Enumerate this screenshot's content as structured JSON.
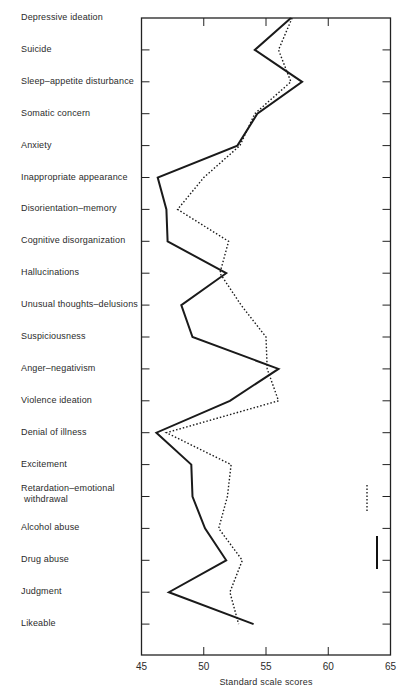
{
  "chart_data": {
    "type": "line",
    "orientation": "horizontal-profile",
    "title": "",
    "xlabel": "Standard scale scores",
    "ylabel": "",
    "xlim": [
      45,
      65
    ],
    "x_ticks": [
      45,
      50,
      55,
      60,
      65
    ],
    "grid": false,
    "categories": [
      "Depressive ideation",
      "Suicide",
      "Sleep-appetite disturbance",
      "Somatic concern",
      "Anxiety",
      "Inappropriate appearance",
      "Disorientation-memory",
      "Cognitive disorganization",
      "Hallucinations",
      "Unusual thoughts-delusions",
      "Suspiciousness",
      "Anger-negativism",
      "Violence ideation",
      "Denial of illness",
      "Excitement",
      "Retardation-emotional withdrawal",
      "Alcohol abuse",
      "Drug abuse",
      "Judgment",
      "Likeable"
    ],
    "series": [
      {
        "name": "solid",
        "style": "solid",
        "color": "#1a1a1a",
        "values": [
          57.0,
          54.1,
          57.9,
          54.3,
          52.7,
          46.3,
          47.0,
          47.1,
          51.8,
          48.2,
          49.1,
          56.0,
          52.1,
          46.2,
          49.0,
          49.1,
          50.1,
          51.8,
          47.2,
          54.0
        ]
      },
      {
        "name": "dotted",
        "style": "dotted",
        "color": "#1a1a1a",
        "values": [
          57.1,
          56.0,
          57.0,
          54.1,
          52.9,
          50.0,
          47.9,
          52.0,
          51.3,
          53.0,
          55.0,
          55.1,
          56.0,
          47.0,
          52.2,
          51.9,
          51.2,
          53.1,
          52.1,
          52.8
        ]
      }
    ],
    "legend": {
      "position": "right-inside",
      "note": "short dotted and solid bar marks at right edge, no text"
    }
  },
  "labels": {
    "categories": [
      "Depressive ideation",
      "Suicide",
      "Sleep–appetite disturbance",
      "Somatic concern",
      "Anxiety",
      "Inappropriate appearance",
      "Disorientation–memory",
      "Cognitive disorganization",
      "Hallucinations",
      "Unusual thoughts–delusions",
      "Suspiciousness",
      "Anger–negativism",
      "Violence ideation",
      "Denial of illness",
      "Excitement",
      "Retardation–emotional\n withdrawal",
      "Alcohol abuse",
      "Drug abuse",
      "Judgment",
      "Likeable"
    ],
    "x_ticks": [
      "45",
      "50",
      "55",
      "60",
      "65"
    ],
    "x_title": "Standard scale scores"
  }
}
